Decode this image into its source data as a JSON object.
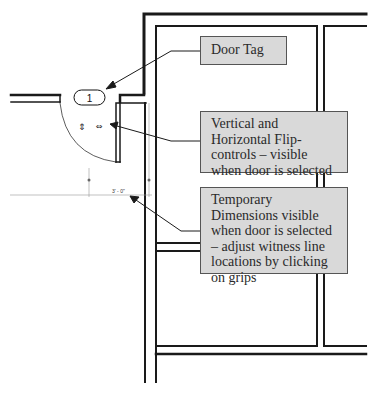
{
  "diagram": {
    "type": "architectural floor plan annotation",
    "door_tag": {
      "number": "1"
    },
    "temporary_dimension": {
      "value": "3' - 0\""
    },
    "flip_controls": {
      "vertical_glyph": "⇕",
      "horizontal_glyph": "⇔"
    },
    "callouts": [
      {
        "id": "door-tag",
        "text": "Door Tag"
      },
      {
        "id": "flip-controls",
        "text": "Vertical and Horizontal Flip-controls – visible when door is selected"
      },
      {
        "id": "temporary-dimensions",
        "text": "Temporary Dimensions visible when door is selected – adjust witness line locations by clicking on grips"
      }
    ],
    "colors": {
      "wall": "#1a1a1a",
      "callout_fill": "#d9d9d9",
      "callout_border": "#555555",
      "callout_text": "#2a2a2a",
      "dimension_line": "#999999"
    }
  }
}
